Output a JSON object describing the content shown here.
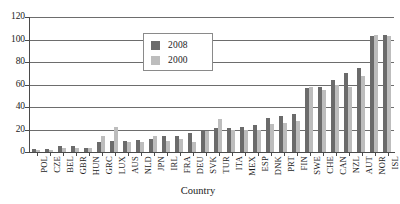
{
  "chart_data": {
    "type": "bar",
    "title": "",
    "xlabel": "Country",
    "ylabel": "",
    "ylim": [
      0,
      120
    ],
    "yticks": [
      0,
      20,
      40,
      60,
      80,
      100,
      120
    ],
    "grid": true,
    "legend_position": "upper-center",
    "categories": [
      "POL",
      "CZE",
      "BEL",
      "GBR",
      "HUN",
      "GRC",
      "LUX",
      "AUS",
      "NLD",
      "JPN",
      "IRL",
      "FRA",
      "DEU",
      "SVK",
      "TUR",
      "ITA",
      "MEX",
      "ESP",
      "DNK",
      "PRT",
      "FIN",
      "SWE",
      "CHE",
      "CAN",
      "NZL",
      "AUT",
      "NOR",
      "ISL"
    ],
    "series": [
      {
        "name": "2008",
        "color": "#6b6b6b",
        "values": [
          3,
          3,
          5,
          5,
          4,
          9,
          10,
          10,
          11,
          12,
          14,
          14,
          17,
          19,
          21,
          21,
          22,
          24,
          30,
          32,
          34,
          57,
          58,
          64,
          70,
          75,
          103,
          104
        ]
      },
      {
        "name": "2000",
        "color": "#bdbdbd",
        "values": [
          2,
          2,
          4,
          4,
          4,
          14,
          22,
          9,
          9,
          14,
          10,
          12,
          9,
          19,
          29,
          20,
          20,
          20,
          25,
          26,
          28,
          58,
          55,
          60,
          58,
          68,
          104,
          103
        ]
      }
    ]
  },
  "legend": {
    "entries": [
      {
        "label": "2008",
        "swatch": "legend-swatch-2008",
        "color": "#6b6b6b"
      },
      {
        "label": "2000",
        "swatch": "legend-swatch-2000",
        "color": "#bdbdbd"
      }
    ]
  },
  "axes": {
    "y_tick_labels": [
      "120",
      "100",
      "80",
      "60",
      "40",
      "20",
      "0"
    ],
    "x_axis_title": "Country"
  },
  "colors": {
    "series_2008": "#6b6b6b",
    "series_2000": "#bdbdbd",
    "axis": "#4a4a4a",
    "gridline": "#6d6d6d",
    "background": "#ffffff"
  }
}
